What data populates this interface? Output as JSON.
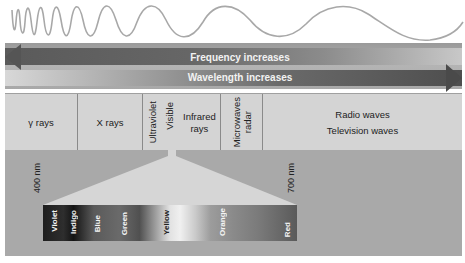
{
  "arrows": {
    "frequency": {
      "label": "Frequency increases",
      "direction": "left"
    },
    "wavelength": {
      "label": "Wavelength increases",
      "direction": "right"
    }
  },
  "bands": [
    {
      "label": "γ rays",
      "orientation": "horizontal"
    },
    {
      "label": "X rays",
      "orientation": "horizontal"
    },
    {
      "label": "Ultraviolet",
      "orientation": "vertical"
    },
    {
      "label": "Visible",
      "orientation": "vertical"
    },
    {
      "label": "Infrared rays",
      "line1": "Infrared",
      "line2": "rays",
      "orientation": "horizontal"
    },
    {
      "label": "Microwaves radar",
      "line1": "Microwaves",
      "line2": "radar",
      "orientation": "vertical"
    },
    {
      "label": "Radio waves / Television waves",
      "line1": "Radio waves",
      "line2": "Television waves",
      "orientation": "horizontal"
    }
  ],
  "visible_spectrum": {
    "start_label": "400 nm",
    "end_label": "700 nm",
    "colors": [
      "Violet",
      "Indigo",
      "Blue",
      "Green",
      "Yellow",
      "Orange",
      "Red"
    ]
  },
  "colors": {
    "arrow_dark": "#555555",
    "band_background": "#d4d4d4",
    "lower_background": "#a9a9a9",
    "cone": "#d8d8d8",
    "wave_line": "#a0a0a0"
  }
}
